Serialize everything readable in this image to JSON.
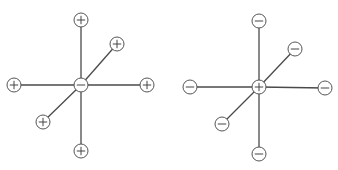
{
  "diagrams": [
    {
      "name": "negative-central-ion",
      "center": {
        "x": 81,
        "y": 85,
        "charge": "-"
      },
      "ligands": [
        {
          "x": 81,
          "y": 20,
          "charge": "+"
        },
        {
          "x": 117,
          "y": 44,
          "charge": "+"
        },
        {
          "x": 14,
          "y": 85,
          "charge": "+"
        },
        {
          "x": 147,
          "y": 85,
          "charge": "+"
        },
        {
          "x": 43,
          "y": 122,
          "charge": "+"
        },
        {
          "x": 81,
          "y": 151,
          "charge": "+"
        }
      ]
    },
    {
      "name": "positive-central-ion",
      "center": {
        "x": 259,
        "y": 87,
        "charge": "+"
      },
      "ligands": [
        {
          "x": 259,
          "y": 21,
          "charge": "-"
        },
        {
          "x": 295,
          "y": 49,
          "charge": "-"
        },
        {
          "x": 190,
          "y": 87,
          "charge": "-"
        },
        {
          "x": 325,
          "y": 88,
          "charge": "-"
        },
        {
          "x": 222,
          "y": 124,
          "charge": "-"
        },
        {
          "x": 259,
          "y": 154,
          "charge": "-"
        }
      ]
    }
  ],
  "style": {
    "ion_radius": 7,
    "line_color": "#4a4a4a",
    "circle_stroke": "#555555"
  }
}
